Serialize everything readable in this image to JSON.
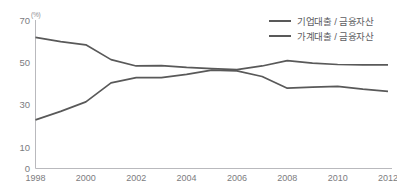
{
  "title": {
    "text_partial": "",
    "visible": false
  },
  "unit_label": "(%)",
  "legend": {
    "position": "top-right",
    "items": [
      {
        "label": "기업대출 / 금융자산",
        "color": "#595959"
      },
      {
        "label": "가계대출 / 금융자산",
        "color": "#595959"
      }
    ]
  },
  "chart_data": {
    "type": "line",
    "title": "",
    "xlabel": "",
    "ylabel": "",
    "unit": "(%)",
    "grid": false,
    "legend_position": "top-right",
    "ylim": [
      0,
      70
    ],
    "yticks": [
      0,
      10,
      30,
      50,
      70
    ],
    "ytick_labels": [
      "0",
      "10",
      "30",
      "50",
      "70"
    ],
    "xlim": [
      1998,
      2012
    ],
    "xticks": [
      1998,
      2000,
      2002,
      2004,
      2006,
      2008,
      2010,
      2012
    ],
    "xtick_labels": [
      "1998",
      "2000",
      "2002",
      "2004",
      "2006",
      "2008",
      "2010",
      "2012"
    ],
    "x": [
      1998,
      1999,
      2000,
      2001,
      2002,
      2003,
      2004,
      2005,
      2006,
      2007,
      2008,
      2009,
      2010,
      2011,
      2012
    ],
    "series": [
      {
        "name": "기업대출 / 금융자산",
        "color": "#595959",
        "values": [
          62.0,
          60.0,
          58.5,
          51.5,
          48.5,
          48.7,
          47.8,
          47.2,
          46.8,
          48.5,
          51.0,
          49.8,
          49.2,
          49.0,
          49.0
        ]
      },
      {
        "name": "가계대출 / 금융자산",
        "color": "#595959",
        "values": [
          23.0,
          27.0,
          31.5,
          40.5,
          43.0,
          43.0,
          44.5,
          46.5,
          46.2,
          43.5,
          38.0,
          38.5,
          38.8,
          37.5,
          36.5
        ]
      }
    ]
  },
  "yticks_render": [
    {
      "label": "70",
      "value": 70
    },
    {
      "label": "50",
      "value": 50
    },
    {
      "label": "30",
      "value": 30
    },
    {
      "label": "10",
      "value": 10
    },
    {
      "label": "0",
      "value": 0
    }
  ],
  "xticks_render": [
    {
      "label": "1998",
      "value": 1998
    },
    {
      "label": "2000",
      "value": 2000
    },
    {
      "label": "2002",
      "value": 2002
    },
    {
      "label": "2004",
      "value": 2004
    },
    {
      "label": "2006",
      "value": 2006
    },
    {
      "label": "2008",
      "value": 2008
    },
    {
      "label": "2010",
      "value": 2010
    },
    {
      "label": "2012",
      "value": 2012
    }
  ]
}
